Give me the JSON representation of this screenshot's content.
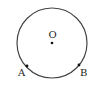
{
  "diagram": {
    "type": "geometry-circle",
    "circle": {
      "cx": 52,
      "cy": 43,
      "r": 35,
      "stroke": "#444444"
    },
    "points": [
      {
        "id": "O",
        "label": "O",
        "x": 52,
        "y": 43,
        "label_x": 48.5,
        "label_y": 38
      },
      {
        "id": "A",
        "label": "A",
        "x": 27,
        "y": 66,
        "label_x": 18,
        "label_y": 76
      },
      {
        "id": "B",
        "label": "B",
        "x": 79,
        "y": 65,
        "label_x": 80,
        "label_y": 76
      }
    ]
  }
}
